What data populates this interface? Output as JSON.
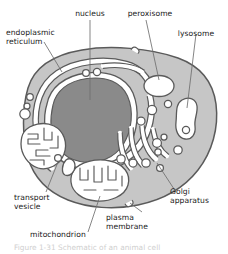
{
  "figure": {
    "kind": "biological-diagram",
    "caption_partial": "Figure 1-31  Schematic of an animal cell",
    "colors": {
      "background": "#ffffff",
      "cytoplasm": "#c6c6c6",
      "nucleoplasm": "#8a8a8a",
      "organelle_lumen": "#ffffff",
      "outline": "#555555",
      "leader_line": "#6f6f6f",
      "text": "#1a1a1a"
    }
  },
  "labels": [
    {
      "id": "nucleus",
      "text": "nucleus",
      "lines": [
        "nucleus"
      ]
    },
    {
      "id": "peroxisome",
      "text": "peroxisome",
      "lines": [
        "peroxisome"
      ]
    },
    {
      "id": "lysosome",
      "text": "lysosome",
      "lines": [
        "lysosome"
      ]
    },
    {
      "id": "endoplasmic-reticulum",
      "text": "endoplasmic reticulum",
      "lines": [
        "endoplasmic",
        "reticulum"
      ]
    },
    {
      "id": "golgi-apparatus",
      "text": "Golgi apparatus",
      "lines": [
        "Golgi",
        "apparatus"
      ]
    },
    {
      "id": "transport-vesicle",
      "text": "transport vesicle",
      "lines": [
        "transport",
        "vesicle"
      ]
    },
    {
      "id": "mitochondrion",
      "text": "mitochondrion",
      "lines": [
        "mitochondrion"
      ]
    },
    {
      "id": "plasma-membrane",
      "text": "plasma membrane",
      "lines": [
        "plasma",
        "membrane"
      ]
    }
  ],
  "label_text": {
    "nucleus": "nucleus",
    "peroxisome": "peroxisome",
    "lysosome": "lysosome",
    "er_line1": "endoplasmic",
    "er_line2": "reticulum",
    "golgi_line1": "Golgi",
    "golgi_line2": "apparatus",
    "vesicle_line1": "transport",
    "vesicle_line2": "vesicle",
    "mitochondrion": "mitochondrion",
    "membrane_line1": "plasma",
    "membrane_line2": "membrane"
  },
  "organelles": [
    {
      "name": "nucleus",
      "count": 1,
      "fill": "#8a8a8a"
    },
    {
      "name": "nuclear-envelope",
      "count": 1,
      "fill": "#ffffff"
    },
    {
      "name": "endoplasmic-reticulum",
      "count": 1,
      "fill": "#ffffff"
    },
    {
      "name": "peroxisome",
      "count": 1,
      "fill": "#ffffff"
    },
    {
      "name": "lysosome",
      "count": 1,
      "fill": "#ffffff"
    },
    {
      "name": "golgi-apparatus",
      "count": 1,
      "fill": "#ffffff"
    },
    {
      "name": "mitochondrion",
      "count": 2,
      "fill": "#ffffff"
    },
    {
      "name": "transport-vesicle",
      "count": 14,
      "fill": "#ffffff"
    },
    {
      "name": "plasma-membrane",
      "count": 1,
      "fill": "#c6c6c6"
    }
  ]
}
